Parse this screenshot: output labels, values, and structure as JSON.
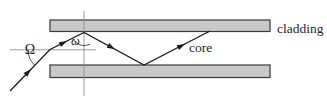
{
  "figure": {
    "labels": {
      "cladding": "cladding",
      "core": "core",
      "incidence_angle": "Ω",
      "internal_angle": "ω"
    },
    "colors": {
      "background": "#ffffff",
      "bar_fill": "#c9c9c9",
      "bar_border": "#3a3a3a",
      "ray": "#1b1b1b",
      "construction_line": "#8f8f8f",
      "text": "#1f1f1f"
    }
  }
}
